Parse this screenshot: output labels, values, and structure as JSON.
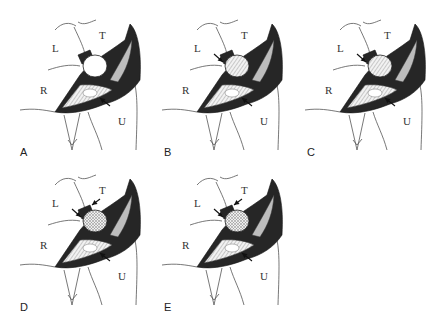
{
  "figure": {
    "panels": [
      {
        "id": "A",
        "label": "A",
        "region_labels": {
          "L": "L",
          "T": "T",
          "R": "R",
          "U": "U"
        },
        "arrows": 1,
        "center_fill": "white"
      },
      {
        "id": "B",
        "label": "B",
        "region_labels": {
          "L": "L",
          "T": "T",
          "R": "R",
          "U": "U"
        },
        "arrows": 2,
        "center_fill": "hatched"
      },
      {
        "id": "C",
        "label": "C",
        "region_labels": {
          "L": "L",
          "T": "T",
          "R": "R",
          "U": "U"
        },
        "arrows": 2,
        "center_fill": "hatched"
      },
      {
        "id": "D",
        "label": "D",
        "region_labels": {
          "L": "L",
          "T": "T",
          "R": "R",
          "U": "U"
        },
        "arrows": 3,
        "center_fill": "cross-hatched"
      },
      {
        "id": "E",
        "label": "E",
        "region_labels": {
          "L": "L",
          "T": "T",
          "R": "R",
          "U": "U"
        },
        "arrows": 3,
        "center_fill": "cross-hatched",
        "lower_stylus_hatched": true
      }
    ]
  }
}
